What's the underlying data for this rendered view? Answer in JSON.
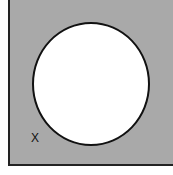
{
  "diagram": {
    "type": "venn",
    "universe": {
      "label": "X",
      "fill": "#a9a9a9",
      "shaded": true
    },
    "sets": [
      {
        "shape": "circle",
        "fill": "#ffffff",
        "shaded": false
      }
    ]
  }
}
